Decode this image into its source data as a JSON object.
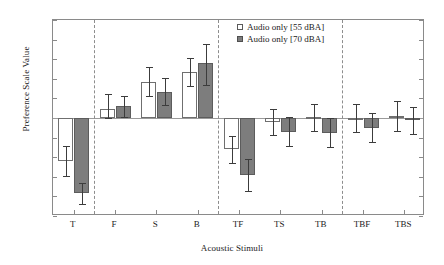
{
  "chart_data": {
    "type": "bar",
    "title": "",
    "subtitle": "",
    "xlabel": "Acoustic Stimuli",
    "ylabel": "Preference Scale Value",
    "categories": [
      "T",
      "F",
      "S",
      "B",
      "TF",
      "TS",
      "TB",
      "TBF",
      "TBS"
    ],
    "ylim": [
      0,
      10
    ],
    "yticks": [
      "0",
      "1",
      "2",
      "3",
      "4",
      "5",
      "6",
      "7",
      "8",
      "9",
      "10"
    ],
    "grid": false,
    "legend_position": "top-center",
    "reference_line": 5,
    "group_dividers_after": [
      "T",
      "B",
      "TB"
    ],
    "series": [
      {
        "name": "Audio only [55 dBA]",
        "color": "#ffffff",
        "edge_color": "#6f6f6f",
        "values": [
          2.8,
          5.45,
          6.85,
          7.35,
          3.4,
          4.8,
          5.05,
          5.0,
          5.1
        ],
        "err_low": [
          2.05,
          5.0,
          6.1,
          6.65,
          2.7,
          4.15,
          4.35,
          4.3,
          4.35
        ],
        "err_high": [
          3.55,
          6.2,
          7.6,
          8.05,
          4.1,
          5.45,
          5.7,
          5.7,
          5.85
        ]
      },
      {
        "name": "Audio only [70 dBA]",
        "color": "#7d7d7d",
        "edge_color": "#5c5c5c",
        "values": [
          1.15,
          5.62,
          6.35,
          7.8,
          2.1,
          4.3,
          4.25,
          4.5,
          4.9
        ],
        "err_low": [
          0.6,
          5.05,
          5.65,
          6.7,
          1.3,
          3.55,
          3.5,
          3.8,
          4.2
        ],
        "err_high": [
          1.7,
          6.12,
          7.05,
          8.8,
          2.9,
          5.05,
          5.0,
          5.25,
          5.55
        ]
      }
    ]
  },
  "legend": {
    "items": [
      {
        "label": "Audio only [55 dBA]",
        "swatch": "light"
      },
      {
        "label": "Audio only [70 dBA]",
        "swatch": "dark"
      }
    ]
  }
}
